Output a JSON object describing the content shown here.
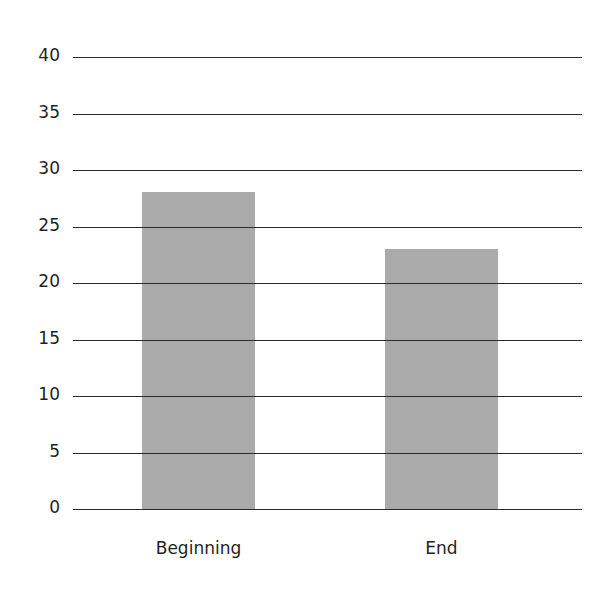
{
  "chart_data": {
    "type": "bar",
    "title": "",
    "xlabel": "",
    "ylabel": "",
    "categories": [
      "Beginning",
      "End"
    ],
    "values": [
      28.1,
      23.1
    ],
    "ylim": [
      0,
      40
    ],
    "yticks": [
      "0",
      "5",
      "10",
      "15",
      "20",
      "25",
      "30",
      "35",
      "40"
    ],
    "grid": true,
    "legend": null,
    "bar_color": "#aaaaaa",
    "grid_color": "#2a2a2a"
  }
}
